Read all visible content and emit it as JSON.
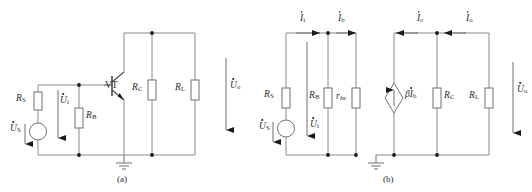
{
  "figure": {
    "background_color": "#ffffff",
    "wire_color": "#8a8a8a",
    "label_color": "#2b2b2b",
    "node_color": "#1a1a1a"
  },
  "panel_a": {
    "caption": "(a)",
    "description": "Common-emitter transistor amplifier schematic",
    "labels": {
      "source_symbol": "U",
      "source_sub": "S",
      "series_resistor": "R",
      "series_resistor_sub": "S",
      "input_voltage": "U",
      "input_voltage_sub": "i",
      "base_resistor": "R",
      "base_resistor_sub": "B",
      "transistor": "VT",
      "collector_resistor": "R",
      "collector_resistor_sub": "C",
      "load_resistor": "R",
      "load_resistor_sub": "L",
      "output_voltage": "U",
      "output_voltage_sub": "o"
    }
  },
  "panel_b": {
    "caption": "(b)",
    "description": "Small-signal hybrid equivalent circuit",
    "labels": {
      "source_symbol": "U",
      "source_sub": "S",
      "series_resistor": "R",
      "series_resistor_sub": "S",
      "input_voltage": "U",
      "input_voltage_sub": "i",
      "input_current": "I",
      "input_current_sub": "i",
      "base_current": "I",
      "base_current_sub": "b",
      "base_resistor": "R",
      "base_resistor_sub": "B",
      "base_emitter_resistance": "r",
      "base_emitter_resistance_sub": "be",
      "dependent_source_beta": "β",
      "dependent_source_current": "I",
      "dependent_source_sub": "b",
      "collector_current": "I",
      "collector_current_sub": "c",
      "collector_resistor": "R",
      "collector_resistor_sub": "C",
      "output_current": "I",
      "output_current_sub": "o",
      "load_resistor": "R",
      "load_resistor_sub": "L",
      "output_voltage": "U",
      "output_voltage_sub": "o"
    }
  }
}
